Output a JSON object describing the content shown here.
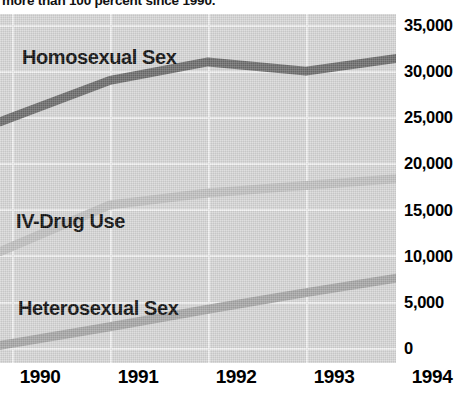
{
  "caption": {
    "text": "more than 100 percent since 1990."
  },
  "chart_data": {
    "type": "line",
    "title": "",
    "xlabel": "",
    "ylabel": "",
    "x": [
      1990,
      1991,
      1992,
      1993,
      1994
    ],
    "categories": [
      "1990",
      "1991",
      "1992",
      "1993",
      "1994"
    ],
    "xtick_labels": [
      "1990",
      "1991",
      "1992",
      "1993",
      "1994"
    ],
    "ytick_labels": [
      "0",
      "5,000",
      "10,000",
      "15,000",
      "20,000",
      "25,000",
      "30,000",
      "35,000"
    ],
    "ytick_values": [
      0,
      5000,
      10000,
      15000,
      20000,
      25000,
      30000,
      35000
    ],
    "ylim": [
      0,
      35000
    ],
    "grid": true,
    "legend_position": "inline-labels",
    "plot_background": "#d8d8d8",
    "series": [
      {
        "name": "Homosexual Sex",
        "color": "#6e6e6e",
        "values": [
          25000,
          29000,
          31000,
          30000,
          31500
        ]
      },
      {
        "name": "IV-Drug Use",
        "color": "#c2c2c2",
        "values": [
          11000,
          15500,
          16800,
          17600,
          18400
        ]
      },
      {
        "name": "Heterosexual Sex",
        "color": "#a8a8a8",
        "values": [
          500,
          2300,
          4200,
          6000,
          7700
        ]
      }
    ]
  }
}
